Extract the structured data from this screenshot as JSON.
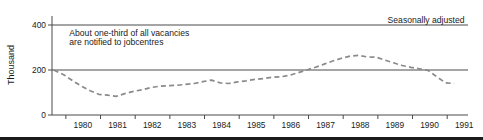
{
  "figure": {
    "background": "#ffffff",
    "axis_color": "#4a4a4a",
    "series_color": "#8a8a8a",
    "text_color": "#1a1a1a",
    "rule_color": "#1b1b1b"
  },
  "chart_data": {
    "type": "line",
    "title": "",
    "subtitle": "",
    "xlabel": "",
    "ylabel": "Thousand",
    "xlim": [
      1979.6,
      1991.6
    ],
    "ylim": [
      0,
      440
    ],
    "grid": true,
    "gridlines_y": [
      200,
      400
    ],
    "legend_position": "none",
    "line_style": "dashed",
    "annotations": [
      {
        "name": "series-note",
        "text": "Seasonally adjusted",
        "x": 1991.5,
        "y": 410,
        "align": "right"
      },
      {
        "name": "annotation-line-1",
        "text": "About one-third of all vacancies",
        "x": 1980.1,
        "y": 350,
        "align": "left"
      },
      {
        "name": "annotation-line-2",
        "text": "are notified to jobcentres",
        "x": 1980.1,
        "y": 310,
        "align": "left"
      }
    ],
    "yticks": [
      0,
      200,
      400
    ],
    "ytick_labels": [
      "0",
      "200",
      "400"
    ],
    "xtick_labels": [
      "1980",
      "1981",
      "1982",
      "1983",
      "1984",
      "1985",
      "1986",
      "1987",
      "1988",
      "1989",
      "1990",
      "1991"
    ],
    "xtick_positions": [
      1980,
      1981,
      1982,
      1983,
      1984,
      1985,
      1986,
      1987,
      1988,
      1989,
      1990,
      1991
    ],
    "series": [
      {
        "name": "Vacancies notified to jobcentres",
        "x": [
          1979.65,
          1979.95,
          1980.2,
          1980.45,
          1980.7,
          1980.95,
          1981.2,
          1981.45,
          1981.7,
          1981.95,
          1982.2,
          1982.45,
          1982.7,
          1982.95,
          1983.2,
          1983.45,
          1983.7,
          1983.95,
          1984.2,
          1984.45,
          1984.7,
          1984.95,
          1985.2,
          1985.45,
          1985.7,
          1985.95,
          1986.2,
          1986.45,
          1986.7,
          1986.95,
          1987.2,
          1987.45,
          1987.7,
          1987.95,
          1988.2,
          1988.45,
          1988.7,
          1988.95,
          1989.2,
          1989.45,
          1989.7,
          1989.95,
          1990.2,
          1990.45,
          1990.7,
          1990.95,
          1991.2
        ],
        "values": [
          200,
          178,
          152,
          128,
          108,
          92,
          88,
          83,
          95,
          105,
          112,
          122,
          128,
          130,
          132,
          136,
          140,
          148,
          155,
          143,
          140,
          147,
          152,
          158,
          162,
          168,
          170,
          176,
          188,
          200,
          212,
          226,
          240,
          252,
          262,
          265,
          258,
          257,
          244,
          232,
          220,
          212,
          205,
          198,
          170,
          143,
          140
        ]
      }
    ]
  }
}
